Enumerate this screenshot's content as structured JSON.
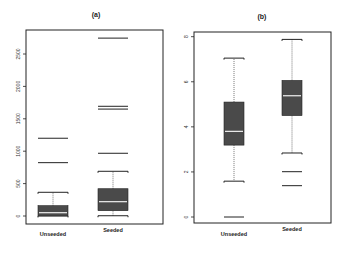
{
  "chart_data": [
    {
      "type": "boxplot",
      "title": "(a)",
      "xlabel": "",
      "ylabel": "",
      "categories": [
        "Unseeded",
        "Seeded"
      ],
      "ylim": [
        0,
        2800
      ],
      "yticks": [
        0,
        500,
        1000,
        1500,
        2000,
        2500
      ],
      "grid": false,
      "series": [
        {
          "name": "Unseeded",
          "whisker_low": 1,
          "q1": 1,
          "median": 51,
          "q3": 159,
          "whisker_high": 366,
          "outliers": [
            823,
            1200
          ]
        },
        {
          "name": "Seeded",
          "whisker_low": 4,
          "q1": 82,
          "median": 221,
          "q3": 421,
          "whisker_high": 690,
          "outliers": [
            968,
            1650,
            1693,
            2745
          ]
        }
      ]
    },
    {
      "type": "boxplot",
      "title": "(b)",
      "xlabel": "",
      "ylabel": "",
      "categories": [
        "Unseeded",
        "Seeded"
      ],
      "ylim": [
        0,
        8
      ],
      "yticks": [
        0,
        2,
        4,
        6,
        8
      ],
      "grid": false,
      "series": [
        {
          "name": "Unseeded",
          "whisker_low": 1.59,
          "q1": 3.19,
          "median": 3.8,
          "q3": 5.1,
          "whisker_high": 7.05,
          "outliers": [
            0
          ]
        },
        {
          "name": "Seeded",
          "whisker_low": 2.84,
          "q1": 4.5,
          "median": 5.38,
          "q3": 6.06,
          "whisker_high": 7.88,
          "outliers": [
            1.39,
            2.01
          ]
        }
      ]
    }
  ],
  "panels": [
    {
      "title": "(a)",
      "yticks": [
        "0",
        "500",
        "1000",
        "1500",
        "2000",
        "2500"
      ],
      "xlabels": [
        "Unseeded",
        "Seeded"
      ]
    },
    {
      "title": "(b)",
      "yticks": [
        "0",
        "2",
        "4",
        "6",
        "8"
      ],
      "xlabels": [
        "Unseeded",
        "Seeded"
      ]
    }
  ],
  "colors": {
    "box_fill": "#4a4a4a",
    "median": "#f0f0f0",
    "frame": "#222222",
    "whisker": "#555555"
  }
}
